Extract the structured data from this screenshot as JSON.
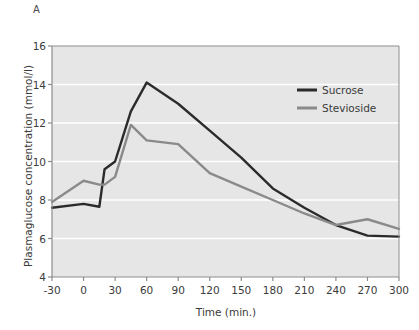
{
  "panel": {
    "label": "A"
  },
  "chart_data": {
    "type": "line",
    "title": "",
    "xlabel": "Time (min.)",
    "ylabel": "Plasmaglucose concentration (mmol/l)",
    "xlim": [
      -30,
      300
    ],
    "ylim": [
      4,
      16
    ],
    "xticks": [
      -30,
      0,
      30,
      60,
      90,
      120,
      150,
      180,
      210,
      240,
      270,
      300
    ],
    "xtick_labels": [
      "-30",
      "0",
      "30",
      "60",
      "90",
      "120",
      "150",
      "180",
      "210",
      "240",
      "270",
      "300"
    ],
    "yticks": [
      4,
      6,
      8,
      10,
      12,
      14,
      16
    ],
    "ytick_labels": [
      "4",
      "6",
      "8",
      "10",
      "12",
      "14",
      "16"
    ],
    "grid": "horizontal-white",
    "plot_background": "#e6e6e6",
    "legend_position": "top-right",
    "series": [
      {
        "name": "Sucrose",
        "color": "#2b2b2b",
        "x": [
          -30,
          0,
          15,
          20,
          30,
          45,
          60,
          90,
          120,
          150,
          180,
          210,
          240,
          270,
          300
        ],
        "values": [
          7.6,
          7.8,
          7.65,
          9.6,
          10.0,
          12.6,
          14.1,
          13.0,
          11.6,
          10.2,
          8.6,
          7.6,
          6.7,
          6.15,
          6.1
        ]
      },
      {
        "name": "Stevioside",
        "color": "#8a8a8a",
        "x": [
          -30,
          0,
          15,
          20,
          30,
          45,
          60,
          90,
          120,
          150,
          180,
          210,
          240,
          270,
          300
        ],
        "values": [
          7.9,
          9.0,
          8.8,
          8.8,
          9.2,
          11.9,
          11.1,
          10.9,
          9.4,
          8.7,
          8.0,
          7.3,
          6.7,
          7.0,
          6.5
        ]
      }
    ]
  },
  "legend": {
    "items": [
      {
        "label": "Sucrose",
        "color": "#2b2b2b"
      },
      {
        "label": "Stevioside",
        "color": "#8a8a8a"
      }
    ]
  }
}
